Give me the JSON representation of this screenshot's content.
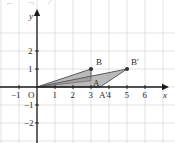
{
  "figure": {
    "top_fragment": "⌐  ¬  ⁄",
    "axis_labels": {
      "x": "x",
      "y": "y",
      "origin": "O"
    },
    "x_ticks": [
      {
        "value": -1,
        "label": "−1"
      },
      {
        "value": 1,
        "label": "1"
      },
      {
        "value": 2,
        "label": "2"
      },
      {
        "value": 3,
        "label": "3"
      },
      {
        "value": 4,
        "label": "4"
      },
      {
        "value": 5,
        "label": "5"
      },
      {
        "value": 6,
        "label": "6"
      }
    ],
    "y_ticks": [
      {
        "value": 2,
        "label": "2"
      },
      {
        "value": 1,
        "label": "1"
      },
      {
        "value": -1,
        "label": "−1"
      },
      {
        "value": -2,
        "label": "−2"
      }
    ],
    "points": [
      {
        "name": "A",
        "label": "A",
        "x": 3,
        "y": 0.35,
        "dot": false,
        "label_dx": 2,
        "label_dy": -2
      },
      {
        "name": "B",
        "label": "B",
        "x": 3,
        "y": 1,
        "dot": true,
        "label_dx": 5,
        "label_dy": -11
      },
      {
        "name": "Ap",
        "label": "A′",
        "x": 3.5,
        "y": 0,
        "dot": false,
        "label_dx": -1,
        "label_dy": 4
      },
      {
        "name": "Bp",
        "label": "B′",
        "x": 5,
        "y": 1,
        "dot": true,
        "label_dx": 4,
        "label_dy": -11
      }
    ],
    "triangles": [
      {
        "name": "original",
        "vertices": [
          [
            0,
            0
          ],
          [
            3,
            0.35
          ],
          [
            3,
            1
          ]
        ]
      },
      {
        "name": "transformed",
        "vertices": [
          [
            0,
            0
          ],
          [
            3.5,
            0
          ],
          [
            5,
            1
          ]
        ]
      }
    ],
    "colors": {
      "grid": "#d6d6d6",
      "axis": "#1a1a1a",
      "shape_fill": "#8f8f8f",
      "shape_stroke": "#5a5a5a",
      "text": "#2b2b2b",
      "background": "#ffffff"
    },
    "axis_ranges": {
      "xlim": [
        -1.7,
        7.4
      ],
      "ylim": [
        -2.9,
        2.9
      ]
    }
  },
  "chart_data": {
    "type": "scatter",
    "title": "",
    "xlabel": "x",
    "ylabel": "y",
    "xlim": [
      -1.7,
      7.4
    ],
    "ylim": [
      -2.9,
      2.9
    ],
    "grid": true,
    "legend": "none",
    "series": [
      {
        "name": "Triangle OAB",
        "x": [
          0,
          3,
          3
        ],
        "y": [
          0,
          0.35,
          1
        ]
      },
      {
        "name": "Triangle OA′B′",
        "x": [
          0,
          3.5,
          5
        ],
        "y": [
          0,
          0,
          1
        ]
      }
    ],
    "annotations": [
      {
        "text": "A",
        "x": 3,
        "y": 0.35
      },
      {
        "text": "B",
        "x": 3,
        "y": 1
      },
      {
        "text": "A′",
        "x": 3.5,
        "y": 0
      },
      {
        "text": "B′",
        "x": 5,
        "y": 1
      }
    ]
  }
}
